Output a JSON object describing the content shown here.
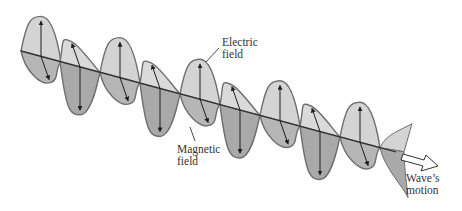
{
  "figure": {
    "colors": {
      "lobe_fill_light": "#d4d4d4",
      "lobe_fill_dark": "#a9a9a9",
      "lobe_stroke": "#6e6e6e",
      "axis": "#2a2a2a",
      "arrow": "#1e1e1e",
      "text": "#333333"
    }
  },
  "labels": {
    "electric_field_line1": "Electric",
    "electric_field_line2": "field",
    "magnetic_field_line1": "Magnetic",
    "magnetic_field_line2": "field",
    "wave_motion_line1": "Wave’s",
    "wave_motion_line2": "motion"
  },
  "geometry": {
    "axis": {
      "x1": 21,
      "y1": 51,
      "x2": 396,
      "y2": 152
    },
    "nodes_x": [
      21,
      60,
      100,
      140,
      180,
      220,
      260,
      300,
      340,
      380
    ],
    "electric_peaks": [
      {
        "x": 41,
        "dir": "up",
        "amp": 40
      },
      {
        "x": 80,
        "dir": "down",
        "amp": 48
      },
      {
        "x": 120,
        "dir": "up",
        "amp": 40
      },
      {
        "x": 160,
        "dir": "down",
        "amp": 48
      },
      {
        "x": 200,
        "dir": "up",
        "amp": 40
      },
      {
        "x": 240,
        "dir": "down",
        "amp": 48
      },
      {
        "x": 280,
        "dir": "up",
        "amp": 40
      },
      {
        "x": 320,
        "dir": "down",
        "amp": 48
      },
      {
        "x": 360,
        "dir": "up",
        "amp": 40
      }
    ]
  }
}
